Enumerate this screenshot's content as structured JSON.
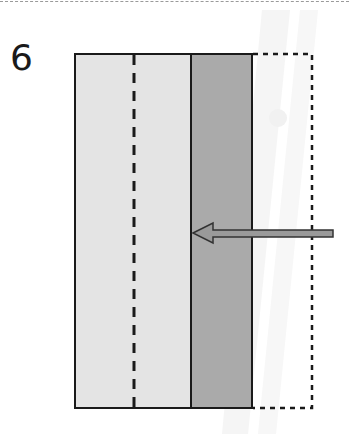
{
  "step": {
    "number": "6"
  },
  "diagram": {
    "colors": {
      "light_panel": "#e4e4e4",
      "dark_panel": "#aaaaaa",
      "outline": "#1a1a1a",
      "arrow_fill": "#9a9a9a",
      "arrow_stroke": "#333333",
      "watermark": "#f0f0f0"
    },
    "elements": [
      "light-panel",
      "center-fold-dashed-line",
      "dark-panel",
      "dotted-outline-original-position",
      "push-left-arrow"
    ]
  }
}
